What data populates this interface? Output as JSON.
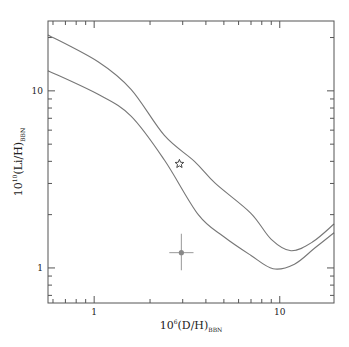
{
  "chart_data": {
    "type": "line",
    "title": "",
    "xlabel": "10^6(D/H)_BBN",
    "xlabel_main": "10",
    "xlabel_sup": "6",
    "xlabel_body": "(D/H)",
    "xlabel_sub": "BBN",
    "ylabel": "10^10(Li/H)_BBN",
    "ylabel_main": "10",
    "ylabel_sup": "10",
    "ylabel_body": "(Li/H)",
    "ylabel_sub": "BBN",
    "xscale": "log",
    "yscale": "log",
    "xlim": [
      0.564,
      19.6
    ],
    "ylim": [
      0.634,
      24.8
    ],
    "x_ticklabels": [
      {
        "value": 1,
        "label": "1"
      },
      {
        "value": 10,
        "label": "10"
      }
    ],
    "y_ticklabels": [
      {
        "value": 1,
        "label": "1"
      },
      {
        "value": 10,
        "label": "10"
      }
    ],
    "grid": false,
    "series": [
      {
        "name": "upper-bound",
        "x": [
          0.564,
          1.05,
          1.58,
          2.39,
          3.47,
          4.5,
          6.97,
          9.0,
          11.5,
          15.0,
          19.6
        ],
        "y": [
          20.7,
          14.6,
          10.2,
          5.6,
          4.0,
          3.0,
          2.04,
          1.45,
          1.25,
          1.4,
          1.77
        ]
      },
      {
        "name": "lower-bound",
        "x": [
          0.564,
          1.05,
          1.58,
          2.39,
          3.64,
          5.0,
          6.97,
          9.2,
          12.0,
          15.5,
          19.6
        ],
        "y": [
          13.0,
          9.56,
          7.2,
          4.07,
          2.0,
          1.5,
          1.18,
          0.99,
          1.05,
          1.3,
          1.58
        ]
      }
    ],
    "markers": [
      {
        "name": "star",
        "x": 2.88,
        "y": 3.87
      },
      {
        "name": "observed-point",
        "x": 2.95,
        "y": 1.22,
        "xerr": [
          2.54,
          3.43
        ],
        "yerr": [
          0.97,
          1.56
        ]
      }
    ]
  }
}
